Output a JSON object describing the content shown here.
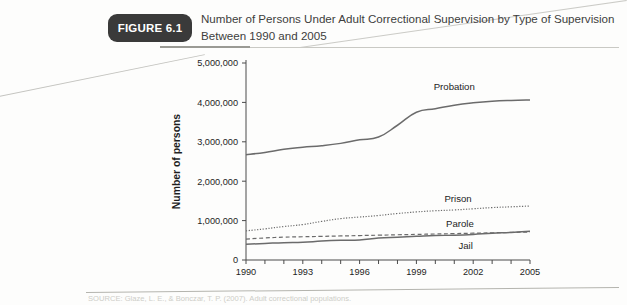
{
  "figure": {
    "badge_label": "FIGURE 6.1",
    "caption_line1": "Number of Persons Under Adult Correctional Supervision by Type of Supervision",
    "caption_line2": "Between 1990 and 2005"
  },
  "source": {
    "text": "SOURCE: Glaze, L. E., & Bonczar, T. P. (2007). Adult correctional populations."
  },
  "chart_data": {
    "type": "line",
    "title": "Number of Persons Under Adult Correctional Supervision by Type of Supervision Between 1990 and 2005",
    "xlabel": "",
    "ylabel": "Number of persons",
    "xlim": [
      1990,
      2005
    ],
    "ylim": [
      0,
      5000000
    ],
    "grid": false,
    "legend_position": "inline-labels",
    "x": [
      1990,
      1991,
      1992,
      1993,
      1994,
      1995,
      1996,
      1997,
      1998,
      1999,
      2000,
      2001,
      2002,
      2003,
      2004,
      2005
    ],
    "xtick_values": [
      1990,
      1991,
      1992,
      1993,
      1994,
      1995,
      1996,
      1997,
      1998,
      1999,
      2000,
      2001,
      2002,
      2003,
      2004,
      2005
    ],
    "xtick_labels_shown": [
      "1990",
      "1993",
      "1996",
      "1999",
      "2002",
      "2005"
    ],
    "xtick_labels_shown_at": [
      1990,
      1993,
      1996,
      1999,
      2002,
      2005
    ],
    "ytick_values": [
      0,
      1000000,
      2000000,
      3000000,
      4000000,
      5000000
    ],
    "ytick_labels": [
      "0",
      "1,000,000",
      "2,000,000",
      "3,000,000",
      "4,000,000",
      "5,000,000"
    ],
    "series": [
      {
        "name": "Probation",
        "style": "solid",
        "label_x": 2001.0,
        "label_y": 4320000,
        "values": [
          2670000,
          2730000,
          2810000,
          2860000,
          2900000,
          2960000,
          3050000,
          3120000,
          3420000,
          3750000,
          3840000,
          3930000,
          3990000,
          4030000,
          4050000,
          4060000
        ]
      },
      {
        "name": "Prison",
        "style": "dotted",
        "label_x": 2001.2,
        "label_y": 1480000,
        "values": [
          740000,
          790000,
          850000,
          900000,
          980000,
          1050000,
          1090000,
          1130000,
          1180000,
          1220000,
          1250000,
          1270000,
          1300000,
          1330000,
          1350000,
          1370000
        ]
      },
      {
        "name": "Parole",
        "style": "dashed",
        "label_x": 2001.3,
        "label_y": 850000,
        "values": [
          530000,
          560000,
          580000,
          590000,
          600000,
          610000,
          620000,
          630000,
          640000,
          650000,
          660000,
          670000,
          680000,
          690000,
          700000,
          710000
        ]
      },
      {
        "name": "Jail",
        "style": "solid",
        "label_x": 2001.6,
        "label_y": 280000,
        "values": [
          400000,
          420000,
          440000,
          450000,
          480000,
          500000,
          510000,
          560000,
          580000,
          600000,
          620000,
          630000,
          650000,
          680000,
          700000,
          730000
        ]
      }
    ]
  }
}
